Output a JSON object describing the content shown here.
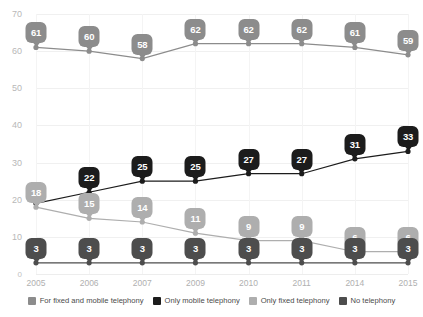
{
  "chart_data": {
    "type": "line",
    "title": "",
    "xlabel": "",
    "ylabel": "",
    "categories": [
      "2005",
      "2006",
      "2007",
      "2009",
      "2010",
      "2011",
      "2014",
      "2015"
    ],
    "ylim": [
      0,
      70
    ],
    "yticks": [
      0,
      10,
      20,
      30,
      40,
      50,
      60,
      70
    ],
    "ytick_labels": [
      "0",
      "10",
      "20",
      "30",
      "40",
      "50",
      "60",
      "70"
    ],
    "grid": true,
    "legend_position": "bottom",
    "series": [
      {
        "name": "For fixed and mobile telephony",
        "color": "#8c8c8c",
        "values": [
          61,
          60,
          58,
          62,
          62,
          62,
          61,
          59
        ],
        "labels": [
          "61",
          "60",
          "58",
          "62",
          "62",
          "62",
          "61",
          "59"
        ]
      },
      {
        "name": "Only mobile telephony",
        "color": "#1c1c1c",
        "values": [
          19,
          22,
          25,
          25,
          27,
          27,
          31,
          33
        ],
        "labels": [
          "",
          "22",
          "25",
          "25",
          "27",
          "27",
          "31",
          "33"
        ]
      },
      {
        "name": "Only fixed telephony",
        "color": "#aeaeae",
        "values": [
          18,
          15,
          14,
          11,
          9,
          9,
          6,
          6
        ],
        "labels": [
          "18",
          "15",
          "14",
          "11",
          "9",
          "9",
          "6",
          "6"
        ]
      },
      {
        "name": "No telephony",
        "color": "#4d4d4d",
        "values": [
          3,
          3,
          3,
          3,
          3,
          3,
          3,
          3
        ],
        "labels": [
          "3",
          "3",
          "3",
          "3",
          "3",
          "3",
          "3",
          "3"
        ]
      }
    ]
  },
  "legend": {
    "items": [
      {
        "label": "For fixed and mobile telephony",
        "color": "#8c8c8c"
      },
      {
        "label": "Only mobile telephony",
        "color": "#1c1c1c"
      },
      {
        "label": "Only fixed telephony",
        "color": "#aeaeae"
      },
      {
        "label": "No telephony",
        "color": "#4d4d4d"
      }
    ]
  }
}
